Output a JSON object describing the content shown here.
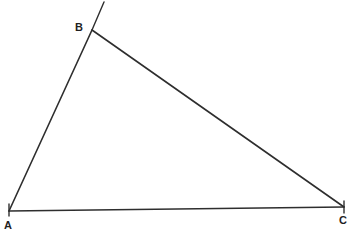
{
  "figure": {
    "kind": "geometry-diagram",
    "width": 352,
    "height": 237,
    "background_color": "#ffffff",
    "stroke_color": "#2e2e2e",
    "stroke_width": 1.6,
    "label_color": "#1f1f1f"
  },
  "vertices": [
    {
      "id": "A",
      "label": "A",
      "x": 9,
      "y": 211,
      "label_x": 4,
      "label_y": 220,
      "tick": "vertical"
    },
    {
      "id": "B",
      "label": "B",
      "x": 92,
      "y": 30,
      "label_x": 75,
      "label_y": 22,
      "tick": "none"
    },
    {
      "id": "C",
      "label": "C",
      "x": 344,
      "y": 207,
      "label_x": 339,
      "label_y": 215,
      "tick": "vertical"
    }
  ],
  "segments": [
    {
      "id": "AB",
      "from": "A",
      "to": "B",
      "x1": 9,
      "y1": 211,
      "x2": 92,
      "y2": 30
    },
    {
      "id": "BC",
      "from": "B",
      "to": "C",
      "x1": 92,
      "y1": 30,
      "x2": 344,
      "y2": 207
    },
    {
      "id": "AC",
      "from": "A",
      "to": "C",
      "x1": 9,
      "y1": 211,
      "x2": 344,
      "y2": 207
    }
  ],
  "rays": [
    {
      "id": "AB-extension",
      "from": "B",
      "x1": 92,
      "y1": 30,
      "x2": 104,
      "y2": 2
    }
  ],
  "ticks": [
    {
      "id": "tick-A",
      "at": "A",
      "x1": 9,
      "y1": 204,
      "x2": 9,
      "y2": 216
    },
    {
      "id": "tick-C",
      "at": "C",
      "x1": 344,
      "y1": 201,
      "x2": 344,
      "y2": 213
    }
  ]
}
